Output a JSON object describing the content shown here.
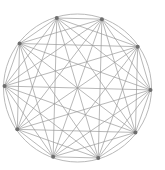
{
  "diagram": {
    "type": "complete-graph",
    "node_count": 10,
    "nodes": [
      "n0",
      "n1",
      "n2",
      "n3",
      "n4",
      "n5",
      "n6",
      "n7",
      "n8",
      "n9"
    ],
    "edges": "all-pairs",
    "has_outer_circle": true,
    "colors": {
      "edge": "#9a9a9a",
      "circle": "#b0b0b0",
      "node": "#6e6e6e",
      "background": "#ffffff"
    }
  }
}
